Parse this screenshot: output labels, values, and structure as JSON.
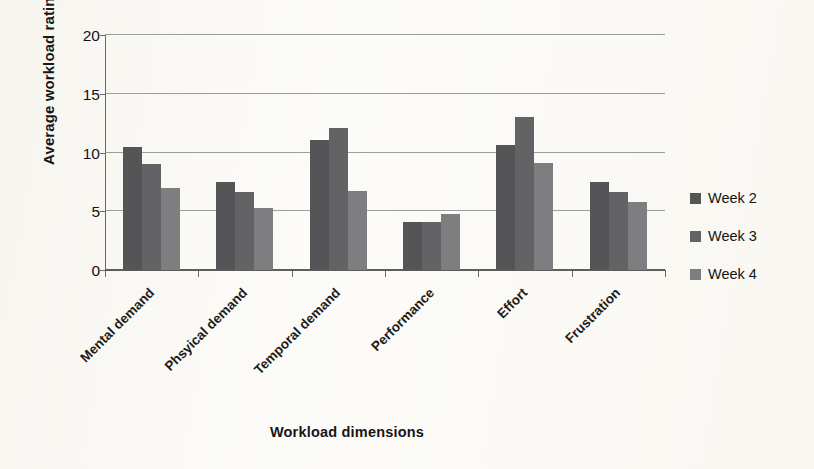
{
  "chart_data": {
    "type": "bar",
    "title": "",
    "xlabel": "Workload dimensions",
    "ylabel": "Average workload rating",
    "categories": [
      "Mental demand",
      "Phsyical demand",
      "Temporal demand",
      "Performance",
      "Effort",
      "Frustration"
    ],
    "series": [
      {
        "name": "Week 2",
        "color": "#555557",
        "values": [
          10.5,
          7.5,
          11.1,
          4.1,
          10.6,
          7.5
        ]
      },
      {
        "name": "Week 3",
        "color": "#636365",
        "values": [
          9.0,
          6.6,
          12.1,
          4.1,
          13.0,
          6.6
        ]
      },
      {
        "name": "Week 4",
        "color": "#7e7e80",
        "values": [
          7.0,
          5.3,
          6.7,
          4.8,
          9.1,
          5.8
        ]
      }
    ],
    "ylim": [
      0,
      20
    ],
    "yticks": [
      0,
      5,
      10,
      15,
      20
    ],
    "ytick_labels": [
      "0",
      "5",
      "10",
      "15",
      "20"
    ],
    "grid": true,
    "legend_position": "right"
  },
  "legend": {
    "items": [
      {
        "label": "Week 2",
        "swatch_name": "legend-swatch-week-2"
      },
      {
        "label": "Week 3",
        "swatch_name": "legend-swatch-week-3"
      },
      {
        "label": "Week 4",
        "swatch_name": "legend-swatch-week-4"
      }
    ]
  }
}
